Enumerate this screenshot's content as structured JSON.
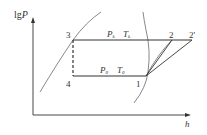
{
  "diagram": {
    "type": "lgP-h refrigeration cycle diagram",
    "axes": {
      "y_label": "lg",
      "y_label_var": "P",
      "x_label": "h"
    },
    "points": {
      "p1": "1",
      "p2": "2",
      "p2prime": "2'",
      "p3": "3",
      "p4": "4"
    },
    "labels": {
      "condensing_pressure": "P",
      "condensing_pressure_sub": "k",
      "condensing_temp": "T",
      "condensing_temp_sub": "k",
      "evaporating_pressure": "P",
      "evaporating_pressure_sub": "0",
      "evaporating_temp": "T",
      "evaporating_temp_sub": "0"
    },
    "colors": {
      "line": "#333333",
      "curve": "#555555",
      "background": "#ffffff"
    }
  }
}
